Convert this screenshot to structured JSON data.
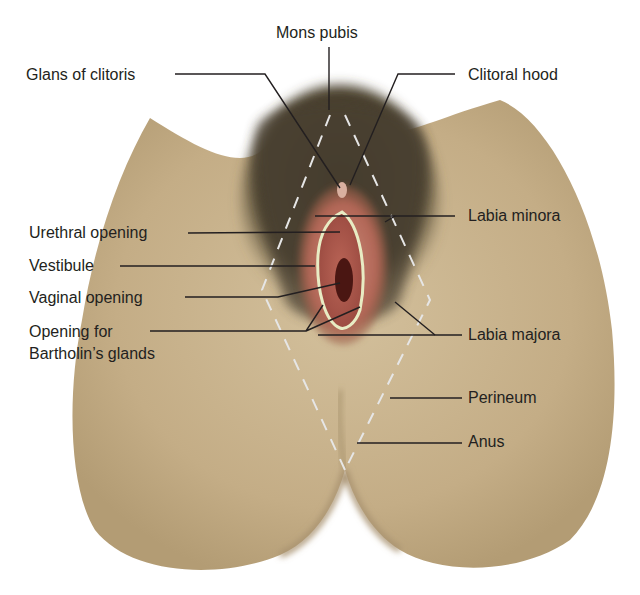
{
  "figure": {
    "type": "anatomical illustration"
  },
  "labels": {
    "mons_pubis": "Mons pubis",
    "glans_of_clitoris": "Glans of clitoris",
    "clitoral_hood": "Clitoral hood",
    "labia_minora": "Labia minora",
    "urethral_opening": "Urethral opening",
    "vestibule": "Vestibule",
    "vaginal_opening": "Vaginal opening",
    "opening_for_bartholins_line1": "Opening for",
    "opening_for_bartholins_line2": "Bartholin’s glands",
    "labia_majora": "Labia majora",
    "perineum": "Perineum",
    "anus": "Anus"
  },
  "colors": {
    "skin": "#c9b48f",
    "skin_shadow": "#9c8862",
    "hair": "#4a3f2a",
    "labia_pink": "#b86b5e",
    "vestibule_inner": "#a24d44",
    "vaginal_dark": "#4a1612",
    "vestibule_outline": "#e8ecc4",
    "leader_line": "#231f20",
    "dashed_outline": "#e6e6e6"
  }
}
